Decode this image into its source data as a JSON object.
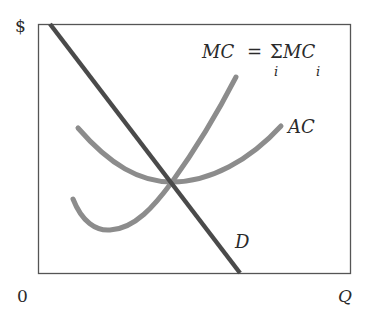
{
  "diagram": {
    "axes": {
      "y_label": "$",
      "x_label": "Q",
      "origin_label": "0"
    },
    "curves": [
      {
        "id": "D",
        "label": "D",
        "description": "Demand curve, downward sloping",
        "color": "#4a4a4a"
      },
      {
        "id": "MC",
        "label": "MC = Σᵢ MCᵢ",
        "description": "Marginal cost curve, U-shaped, crosses AC at its minimum",
        "color": "#8c8c8c"
      },
      {
        "id": "AC",
        "label": "AC",
        "description": "Average cost curve, U-shaped",
        "color": "#8c8c8c"
      }
    ],
    "mc_label": {
      "lhs": "MC",
      "equals": "=",
      "sigma": "Σ",
      "rhs": "MC",
      "sigma_subscript": "i",
      "rhs_subscript": "i"
    },
    "ac_label": "AC",
    "d_label": "D",
    "intersection": "D, MC and AC intersect at minimum of AC"
  }
}
